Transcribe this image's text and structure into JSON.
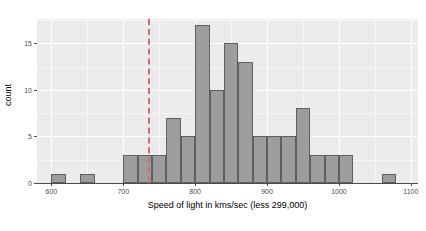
{
  "chart_data": {
    "type": "bar",
    "title": "",
    "subtitle": "",
    "xlabel": "Speed of light in kms/sec (less 299,000)",
    "ylabel": "count",
    "xlim": [
      580,
      1110
    ],
    "ylim": [
      0,
      17.6
    ],
    "xticks": [
      600,
      700,
      800,
      900,
      1000,
      1100
    ],
    "xtick_labels": [
      "600",
      "700",
      "800",
      "900",
      "1000",
      "1100"
    ],
    "yticks": [
      0,
      5,
      10,
      15
    ],
    "ytick_labels": [
      "0",
      "5",
      "10",
      "15"
    ],
    "grid": true,
    "grid_color": "#ffffff",
    "panel_background": "#ebebeb",
    "legend": "none",
    "bin_width": 20,
    "bin_starts": [
      600,
      620,
      640,
      660,
      680,
      700,
      720,
      740,
      760,
      780,
      800,
      820,
      840,
      860,
      880,
      900,
      920,
      940,
      960,
      980,
      1000,
      1020,
      1040,
      1060
    ],
    "categories": [
      "600-620",
      "620-640",
      "640-660",
      "660-680",
      "680-700",
      "700-720",
      "720-740",
      "740-760",
      "760-780",
      "780-800",
      "800-820",
      "820-840",
      "840-860",
      "860-880",
      "880-900",
      "900-920",
      "920-940",
      "940-960",
      "960-980",
      "980-1000",
      "1000-1020",
      "1020-1040",
      "1040-1060",
      "1060-1080"
    ],
    "values": [
      1,
      0,
      1,
      0,
      0,
      3,
      3,
      3,
      7,
      5,
      17,
      10,
      15,
      13,
      5,
      5,
      5,
      8,
      3,
      3,
      3,
      0,
      0,
      1
    ],
    "bar_fill": "#9d9d9d",
    "bar_border": "#5f5f5f",
    "annotations": [
      {
        "name": "reference-line",
        "type": "vline",
        "value": 734.5,
        "style": "dashed",
        "color": "#d06c6c"
      }
    ]
  }
}
